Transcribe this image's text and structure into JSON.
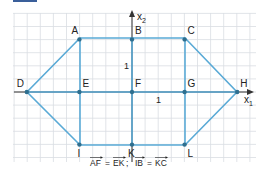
{
  "figure": {
    "colors": {
      "grid": "#d9dde2",
      "axis": "#333333",
      "shape": "#5aaad6",
      "point": "#2f6f8f",
      "header_bar": "#3a5f9a"
    },
    "axes": {
      "x_label": "x",
      "x_sub": "1",
      "y_label": "x",
      "y_sub": "2",
      "x_unit_tick": "1",
      "y_unit_tick": "1"
    },
    "points": [
      {
        "name": "A",
        "x": -2,
        "y": 2
      },
      {
        "name": "B",
        "x": 0,
        "y": 2
      },
      {
        "name": "C",
        "x": 2,
        "y": 2
      },
      {
        "name": "D",
        "x": -4,
        "y": 0
      },
      {
        "name": "E",
        "x": -2,
        "y": 0
      },
      {
        "name": "F",
        "x": 0,
        "y": 0
      },
      {
        "name": "G",
        "x": 2,
        "y": 0
      },
      {
        "name": "H",
        "x": 4,
        "y": 0
      },
      {
        "name": "I",
        "x": -2,
        "y": -2
      },
      {
        "name": "K",
        "x": 0,
        "y": -2
      },
      {
        "name": "L",
        "x": 2,
        "y": -2
      }
    ],
    "caption": {
      "v1a": "AF",
      "eq1": "=",
      "v1b": "EK",
      "sep": ";",
      "v2a": "IB",
      "eq2": "=",
      "v2b": "KC"
    }
  }
}
